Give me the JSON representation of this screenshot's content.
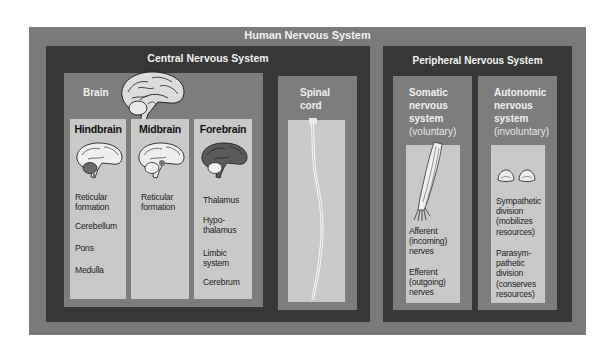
{
  "title": "Human Nervous System",
  "cns": {
    "title": "Central Nervous System",
    "brain": {
      "label": "Brain",
      "icon": "brain-sagittal-icon",
      "divisions": [
        {
          "name": "Hindbrain",
          "icon": "brain-hindbrain-highlight-icon",
          "items": [
            "Reticular formation",
            "Cerebellum",
            "Pons",
            "Medulla"
          ]
        },
        {
          "name": "Midbrain",
          "icon": "brain-midbrain-highlight-icon",
          "items": [
            "Reticular formation"
          ]
        },
        {
          "name": "Forebrain",
          "icon": "brain-forebrain-highlight-icon",
          "items": [
            "Thalamus",
            "Hypo-thalamus",
            "Limbic system",
            "Cerebrum"
          ]
        }
      ]
    },
    "spinal_cord": {
      "label_line1": "Spinal",
      "label_line2": "cord",
      "icon": "spinal-cord-icon"
    }
  },
  "pns": {
    "title": "Peripheral Nervous System",
    "somatic": {
      "label_lines": [
        "Somatic",
        "nervous",
        "system"
      ],
      "qualifier": "(voluntary)",
      "icon": "arm-nerves-icon",
      "items": [
        "Afferent (incoming) nerves",
        "Efferent (outgoing) nerves"
      ]
    },
    "autonomic": {
      "label_lines": [
        "Autonomic",
        "nervous",
        "system"
      ],
      "qualifier": "(involuntary)",
      "icon": "adrenal-glands-icon",
      "items": [
        "Sympathetic division (mobilizes resources)",
        "Parasym-pathetic division (conserves resources)"
      ]
    }
  },
  "colors": {
    "outer": "#7a7a7a",
    "dark": "#373737",
    "mid": "#7d7d7d",
    "light": "#c9c9c9",
    "header_text": "#f2f2f2"
  }
}
